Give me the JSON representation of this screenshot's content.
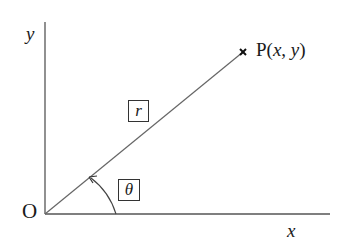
{
  "diagram": {
    "type": "polar-coordinates",
    "origin_label": "O",
    "x_axis_label": "x",
    "y_axis_label": "y",
    "point_label_prefix": "P(",
    "point_label_x": "x",
    "point_label_sep": ", ",
    "point_label_y": "y",
    "point_label_suffix": ")",
    "radius_label": "r",
    "angle_label": "θ",
    "colors": {
      "axis": "#555555",
      "line": "#666666",
      "text": "#1a1a1a",
      "background": "#ffffff"
    }
  }
}
